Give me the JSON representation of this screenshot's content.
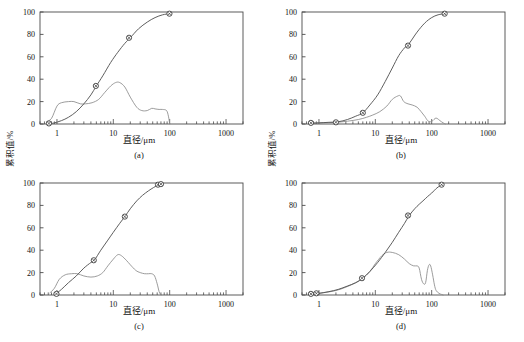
{
  "figure": {
    "background": "#ffffff",
    "axis_color": "#4a4a4a",
    "cumulative_curve_color": "#555555",
    "frequency_curve_color": "#8a8a8a",
    "marker_color": "#333333",
    "panel_count": 4
  },
  "axes": {
    "x_label": "直径/μm",
    "y_label": "累积值/%",
    "x_ticks": [
      "1",
      "10",
      "100",
      "1000"
    ],
    "x_tick_values": [
      1,
      10,
      100,
      1000
    ],
    "y_ticks": [
      "0",
      "20",
      "40",
      "60",
      "80",
      "100"
    ],
    "y_tick_values": [
      0,
      20,
      40,
      60,
      80,
      100
    ],
    "x_min": 0.5,
    "x_max": 2000,
    "y_min": 0,
    "y_max": 100,
    "x_scale": "log",
    "grid": "off"
  },
  "captions": {
    "a": "(a)",
    "b": "(b)",
    "c": "(c)",
    "d": "(d)"
  },
  "chart_data": [
    {
      "type": "line",
      "panel": "a",
      "title": "(a)",
      "xlabel": "直径/μm",
      "ylabel": "累积值/%",
      "xlim": [
        0.5,
        2000
      ],
      "ylim": [
        0,
        100
      ],
      "xscale": "log",
      "grid": "off",
      "series": [
        {
          "name": "累积值",
          "style": "line-with-markers",
          "x": [
            0.7,
            0.9,
            1.2,
            1.6,
            2.2,
            3.0,
            4.0,
            5.0,
            6.5,
            9,
            12,
            16,
            20,
            28,
            40,
            55,
            75,
            100
          ],
          "y": [
            0,
            1,
            3,
            6,
            11,
            18,
            26,
            34,
            43,
            55,
            64,
            72,
            77,
            85,
            91,
            95,
            97.5,
            98.5
          ]
        },
        {
          "name": "频率分布",
          "style": "line",
          "x": [
            0.65,
            0.8,
            1.0,
            1.2,
            1.6,
            2.0,
            2.6,
            3.2,
            4.2,
            5.5,
            7,
            9,
            11,
            13,
            16,
            20,
            26,
            32,
            40,
            48,
            55,
            65,
            75,
            88,
            95,
            100
          ],
          "y": [
            2,
            5,
            16,
            19,
            20,
            20,
            18,
            18,
            19,
            22,
            28,
            34,
            37,
            37,
            33,
            24,
            15,
            12,
            12,
            14,
            13.5,
            13,
            13,
            12,
            7,
            0
          ]
        }
      ],
      "markers": [
        {
          "x": 0.72,
          "y": 0.5
        },
        {
          "x": 4.9,
          "y": 34
        },
        {
          "x": 19,
          "y": 77
        },
        {
          "x": 99,
          "y": 98.5
        }
      ]
    },
    {
      "type": "line",
      "panel": "b",
      "title": "(b)",
      "xlabel": "直径/μm",
      "ylabel": "累积值/%",
      "xlim": [
        0.5,
        2000
      ],
      "ylim": [
        0,
        100
      ],
      "xscale": "log",
      "grid": "off",
      "series": [
        {
          "name": "累积值",
          "style": "line-with-markers",
          "x": [
            0.7,
            1.0,
            1.5,
            2.2,
            3.2,
            4.5,
            6,
            8,
            11,
            15,
            20,
            26,
            33,
            40,
            55,
            75,
            100,
            130,
            170
          ],
          "y": [
            0.5,
            1,
            1.5,
            2,
            4,
            7,
            10,
            17,
            26,
            38,
            50,
            61,
            68,
            72,
            82,
            90,
            95,
            97.5,
            98.5
          ]
        },
        {
          "name": "频率分布",
          "style": "line",
          "x": [
            0.7,
            1.2,
            2.0,
            3.2,
            5.0,
            7,
            9,
            12,
            16,
            20,
            25,
            28,
            32,
            38,
            45,
            55,
            65,
            75,
            85,
            95,
            105,
            115,
            125,
            140,
            160,
            175
          ],
          "y": [
            1,
            1,
            1.5,
            2.5,
            4,
            6,
            8,
            11,
            16,
            22,
            25,
            25,
            20,
            18,
            17,
            15,
            11,
            7,
            3,
            2,
            3,
            5,
            5,
            3,
            1,
            0
          ]
        }
      ],
      "markers": [
        {
          "x": 0.72,
          "y": 1
        },
        {
          "x": 2.0,
          "y": 1.5
        },
        {
          "x": 6.0,
          "y": 10
        },
        {
          "x": 38,
          "y": 70
        },
        {
          "x": 170,
          "y": 98.5
        }
      ]
    },
    {
      "type": "line",
      "panel": "c",
      "title": "(c)",
      "xlabel": "直径/μm",
      "ylabel": "累积值/%",
      "xlim": [
        0.5,
        2000
      ],
      "ylim": [
        0,
        100
      ],
      "xscale": "log",
      "grid": "off",
      "series": [
        {
          "name": "累积值",
          "style": "line-with-markers",
          "x": [
            0.95,
            1.2,
            1.6,
            2.2,
            3.0,
            4.0,
            4.6,
            6,
            8,
            10,
            13,
            16,
            20,
            26,
            33,
            42,
            52,
            64,
            70
          ],
          "y": [
            1,
            5,
            11,
            17,
            24,
            29,
            31,
            40,
            49,
            56,
            64,
            70,
            77,
            84,
            89,
            93,
            96,
            98.5,
            99
          ]
        },
        {
          "name": "频率分布",
          "style": "line",
          "x": [
            0.75,
            0.9,
            1.1,
            1.4,
            1.8,
            2.3,
            3.0,
            4.0,
            5.2,
            6.5,
            8,
            10,
            12,
            14,
            17,
            20,
            25,
            30,
            36,
            42,
            48,
            54,
            60,
            65,
            70
          ],
          "y": [
            2,
            6,
            14,
            18,
            19,
            19,
            17,
            16,
            17,
            20,
            26,
            32,
            36,
            35,
            31,
            27,
            22,
            20,
            19,
            19,
            19,
            17,
            10,
            3,
            0
          ]
        }
      ],
      "markers": [
        {
          "x": 0.98,
          "y": 1
        },
        {
          "x": 4.5,
          "y": 31
        },
        {
          "x": 16,
          "y": 70
        },
        {
          "x": 62,
          "y": 98.5
        },
        {
          "x": 70,
          "y": 99
        }
      ]
    },
    {
      "type": "line",
      "panel": "d",
      "title": "(d)",
      "xlabel": "直径/μm",
      "ylabel": "累积值/%",
      "xlim": [
        0.5,
        2000
      ],
      "ylim": [
        0,
        100
      ],
      "xscale": "log",
      "grid": "off",
      "series": [
        {
          "name": "累积值",
          "style": "line-with-markers",
          "x": [
            0.7,
            1.0,
            1.5,
            2.2,
            3.2,
            4.5,
            6,
            8,
            11,
            15,
            20,
            26,
            33,
            40,
            50,
            60,
            70,
            85,
            100,
            120,
            140,
            155
          ],
          "y": [
            0.5,
            1.5,
            3,
            5,
            8,
            11,
            15,
            21,
            29,
            38,
            47,
            56,
            64,
            71,
            77,
            81,
            84,
            88,
            91,
            95,
            97.5,
            98.5
          ]
        },
        {
          "name": "频率分布",
          "style": "line",
          "x": [
            0.7,
            1.2,
            2.0,
            3.0,
            4.5,
            6,
            8,
            10,
            13,
            16,
            20,
            26,
            33,
            40,
            48,
            55,
            60,
            66,
            72,
            78,
            84,
            90,
            96,
            104,
            112,
            120,
            135,
            150,
            160
          ],
          "y": [
            0.5,
            2,
            4,
            7,
            11,
            15,
            21,
            28,
            35,
            38,
            38,
            36,
            32,
            28,
            26,
            26,
            24,
            14,
            10,
            11,
            22,
            27,
            26,
            18,
            9,
            4,
            1.5,
            0.5,
            0
          ]
        }
      ],
      "markers": [
        {
          "x": 0.72,
          "y": 1
        },
        {
          "x": 0.9,
          "y": 1.5
        },
        {
          "x": 5.8,
          "y": 15
        },
        {
          "x": 38,
          "y": 71
        },
        {
          "x": 150,
          "y": 98.5
        }
      ]
    }
  ]
}
